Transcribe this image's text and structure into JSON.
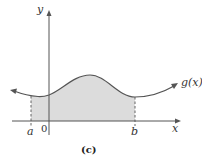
{
  "figure": {
    "caption": "(c)",
    "function_label": "g(x)",
    "x_axis_label": "x",
    "y_axis_label": "y",
    "origin_label": "0",
    "lower_bound_label": "a",
    "upper_bound_label": "b",
    "shade_color": "#dcdcdc",
    "curve_color": "#555555"
  }
}
